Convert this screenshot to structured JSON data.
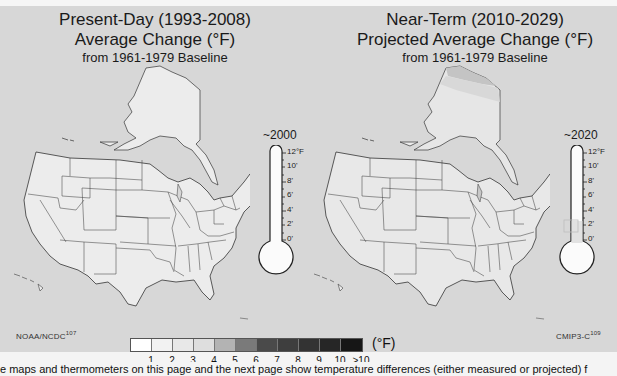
{
  "left_panel": {
    "title_line1": "Present-Day (1993-2008)",
    "title_line2": "Average Change (°F)",
    "title_line3": "from 1961-1979 Baseline",
    "thermometer": {
      "year_label": "~2000",
      "ticks": [
        "12°F",
        "10'",
        "8'",
        "6'",
        "4'",
        "2'",
        "0'"
      ],
      "fill_value_f": 0
    },
    "source": "NOAA/NCDC",
    "source_ref": "107"
  },
  "right_panel": {
    "title_line1": "Near-Term (2010-2029)",
    "title_line2": "Projected Average Change (°F)",
    "title_line3": "from 1961-1979 Baseline",
    "thermometer": {
      "year_label": "~2020",
      "ticks": [
        "12°F",
        "10'",
        "8'",
        "6'",
        "4'",
        "2'",
        "0'"
      ],
      "fill_value_f": 2.5
    },
    "source": "CMIP3-C",
    "source_ref": "109"
  },
  "legend": {
    "unit": "(°F)",
    "labels": [
      "1",
      "2",
      "3",
      "4",
      "5",
      "6",
      "7",
      "8",
      "9",
      "10",
      ">10"
    ],
    "colors": [
      "#ffffff",
      "#f2f2f2",
      "#e8e8e8",
      "#dedede",
      "#b3b3b3",
      "#7a7a7a",
      "#4a4a4a",
      "#3e3e3e",
      "#333333",
      "#262626",
      "#161616"
    ]
  },
  "caption": "e maps and thermometers on this page and the next page show temperature differences (either measured or projected) f",
  "colors": {
    "panel_background": "#d7d7d7",
    "land_fill": "#ececec",
    "border_line": "#333333"
  }
}
